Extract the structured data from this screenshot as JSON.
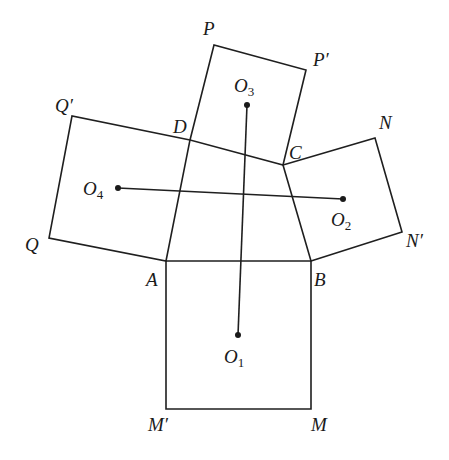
{
  "figure": {
    "quadrilateral": [
      "A",
      "B",
      "C",
      "D"
    ],
    "vertices": {
      "A": {
        "label": "A",
        "x": 166,
        "y": 261,
        "lx": 146,
        "ly": 286
      },
      "B": {
        "label": "B",
        "x": 311,
        "y": 261,
        "lx": 314,
        "ly": 286
      },
      "C": {
        "label": "C",
        "x": 283,
        "y": 165,
        "lx": 289,
        "ly": 159
      },
      "D": {
        "label": "D",
        "x": 190,
        "y": 140,
        "lx": 173,
        "ly": 133
      },
      "P": {
        "label": "P",
        "x": 214,
        "y": 45,
        "lx": 203,
        "ly": 35
      },
      "P_prime": {
        "label": "P′",
        "x": 306,
        "y": 70,
        "lx": 313,
        "ly": 66
      },
      "Q": {
        "label": "Q",
        "x": 49,
        "y": 238,
        "lx": 25,
        "ly": 251
      },
      "Q_prime": {
        "label": "Q′",
        "x": 72,
        "y": 116,
        "lx": 55,
        "ly": 112
      },
      "N": {
        "label": "N",
        "x": 375,
        "y": 138,
        "lx": 379,
        "ly": 129
      },
      "N_prime": {
        "label": "N′",
        "x": 402,
        "y": 232,
        "lx": 406,
        "ly": 247
      },
      "M": {
        "label": "M",
        "x": 311,
        "y": 409,
        "lx": 311,
        "ly": 431
      },
      "M_prime": {
        "label": "M′",
        "x": 166,
        "y": 409,
        "lx": 148,
        "ly": 431
      }
    },
    "squares": [
      {
        "name": "square-on-AB",
        "points": [
          "A",
          "B",
          "M",
          "M_prime"
        ]
      },
      {
        "name": "square-on-BC",
        "points": [
          "B",
          "N_prime",
          "N",
          "C"
        ]
      },
      {
        "name": "square-on-CD",
        "points": [
          "C",
          "P_prime",
          "P",
          "D"
        ]
      },
      {
        "name": "square-on-DA",
        "points": [
          "D",
          "Q_prime",
          "Q",
          "A"
        ]
      }
    ],
    "centers": {
      "O1": {
        "label": "O",
        "sub": "1",
        "x": 238,
        "y": 335,
        "lx": 224,
        "ly": 363
      },
      "O2": {
        "label": "O",
        "sub": "2",
        "x": 343,
        "y": 199,
        "lx": 331,
        "ly": 226
      },
      "O3": {
        "label": "O",
        "sub": "3",
        "x": 247,
        "y": 105,
        "lx": 234,
        "ly": 92
      },
      "O4": {
        "label": "O",
        "sub": "4",
        "x": 118,
        "y": 188,
        "lx": 83,
        "ly": 195
      }
    },
    "segments": [
      {
        "name": "O1O3",
        "from": "O1",
        "to": "O3"
      },
      {
        "name": "O2O4",
        "from": "O2",
        "to": "O4"
      }
    ],
    "caption": ""
  }
}
